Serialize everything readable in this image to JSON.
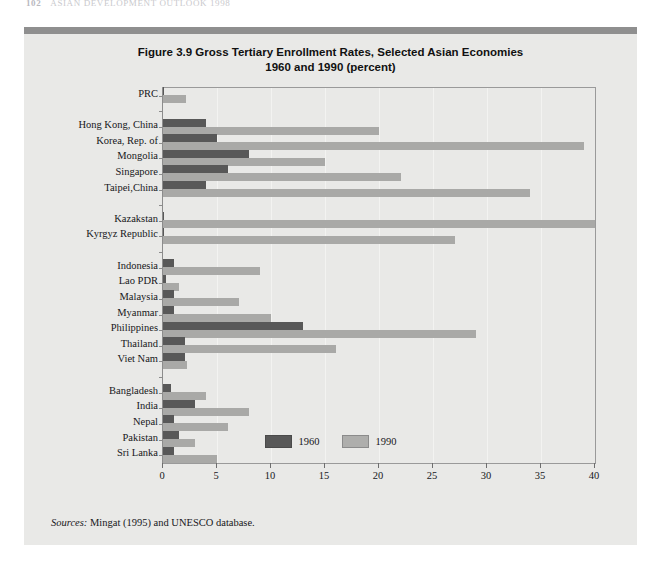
{
  "running_head": {
    "page_number": "102",
    "text": "ASIAN DEVELOPMENT OUTLOOK 1998"
  },
  "figure": {
    "title_line1": "Figure 3.9 Gross Tertiary Enrollment Rates, Selected Asian Economies",
    "title_line2": "1960 and 1990 (percent)",
    "sources_label": "Sources:",
    "sources_text": " Mingat (1995) and UNESCO database."
  },
  "colors": {
    "panel_background": "#e9e9e7",
    "panel_topbar": "#8f8f8f",
    "series_1960": "#585858",
    "series_1990": "#a9a9a7",
    "axis": "#8c8c8c",
    "gridline": "#f3f3f1",
    "text": "#17171a"
  },
  "legend": {
    "position": "bottom-center",
    "items": [
      {
        "label": "1960",
        "color": "#585858"
      },
      {
        "label": "1990",
        "color": "#aeaeac"
      }
    ]
  },
  "chart_data": {
    "type": "bar",
    "orientation": "horizontal",
    "title": "Figure 3.9 Gross Tertiary Enrollment Rates, Selected Asian Economies 1960 and 1990 (percent)",
    "xlabel": "",
    "ylabel": "",
    "xlim": [
      0,
      40
    ],
    "xticks": [
      0,
      5,
      10,
      15,
      20,
      25,
      30,
      35,
      40
    ],
    "grid": true,
    "grid_axis": "x",
    "categories": [
      "PRC",
      "",
      "Hong Kong, China",
      "Korea, Rep. of",
      "Mongolia",
      "Singapore",
      "Taipei,China",
      "",
      "Kazakstan",
      "Kyrgyz Republic",
      "",
      "Indonesia",
      "Lao PDR",
      "Malaysia",
      "Myanmar",
      "Philippines",
      "Thailand",
      "Viet Nam",
      "",
      "Bangladesh",
      "India",
      "Nepal",
      "Pakistan",
      "Sri Lanka"
    ],
    "series": [
      {
        "name": "1960",
        "color": "#585858",
        "values": [
          0.1,
          null,
          4.0,
          5.0,
          8.0,
          6.0,
          4.0,
          null,
          0.0,
          0.0,
          null,
          1.0,
          0.3,
          1.0,
          1.0,
          13.0,
          2.0,
          2.0,
          null,
          0.7,
          3.0,
          1.0,
          1.5,
          1.0
        ]
      },
      {
        "name": "1990",
        "color": "#a9a9a7",
        "values": [
          2.1,
          null,
          20.0,
          39.0,
          15.0,
          22.0,
          34.0,
          null,
          40.0,
          27.0,
          null,
          9.0,
          1.5,
          7.0,
          10.0,
          29.0,
          16.0,
          2.2,
          null,
          4.0,
          8.0,
          6.0,
          3.0,
          5.0
        ]
      }
    ],
    "group_breaks": [
      1,
      7,
      10,
      18
    ]
  }
}
